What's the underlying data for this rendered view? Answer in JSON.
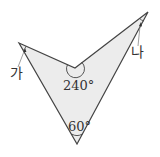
{
  "diagram": {
    "type": "concave quadrilateral (dart shape) with marked angles",
    "fill_color": "#ececec",
    "stroke_color": "#444444",
    "vertices": {
      "left_tip": [
        19,
        43
      ],
      "inner_reflex": [
        75,
        68
      ],
      "right_tip": [
        148,
        12
      ],
      "bottom_tip": [
        77,
        144
      ]
    },
    "angles": {
      "inner_reflex_angle": "240°",
      "bottom_angle": "60°"
    },
    "labels": {
      "left_angle": "가",
      "right_angle": "나"
    }
  }
}
